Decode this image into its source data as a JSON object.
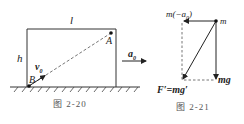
{
  "figure_2_20": {
    "caption": "图   2-20",
    "labels": {
      "length": "l",
      "height": "h",
      "point_a": "A",
      "point_b": "B",
      "velocity": "v",
      "velocity_sub": "0",
      "acceleration": "a",
      "acceleration_sub": "0"
    }
  },
  "figure_2_21": {
    "caption": "图   2-21",
    "labels": {
      "inertial_force": "m(−a",
      "inertial_force_sub": "0",
      "inertial_force_close": ")",
      "mass": "m",
      "gravity": "mg",
      "effective_gravity": "F′=mg′"
    }
  },
  "colors": {
    "line": "#333333",
    "dashed": "#666666",
    "caption": "#555555"
  }
}
